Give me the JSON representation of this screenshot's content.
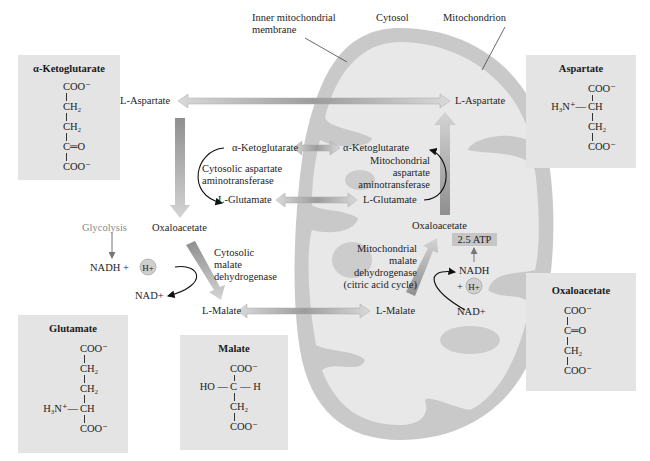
{
  "figure": {
    "top_labels": {
      "inner_membrane_line1": "Inner mitochondrial",
      "inner_membrane_line2": "membrane",
      "cytosol": "Cytosol",
      "mitochondrion": "Mitochondrion"
    },
    "cytosol_side": {
      "l_aspartate": "L-Aspartate",
      "alpha_ketoglutarate": "α-Ketoglutarate",
      "enzyme_aat_line1": "Cytosolic aspartate",
      "enzyme_aat_line2": "aminotransferase",
      "l_glutamate": "L-Glutamate",
      "oxaloacetate": "Oxaloacetate",
      "glycolysis": "Glycolysis",
      "nadh_plus": "NADH +",
      "h_plus": "H+",
      "nad_plus": "NAD+",
      "enzyme_mdh_line1": "Cytosolic",
      "enzyme_mdh_line2": "malate",
      "enzyme_mdh_line3": "dehydrogenase",
      "l_malate": "L-Malate"
    },
    "matrix_side": {
      "l_aspartate": "L-Aspartate",
      "alpha_ketoglutarate": "α-Ketoglutarate",
      "enzyme_aat_line1": "Mitochondrial",
      "enzyme_aat_line2": "aspartate",
      "enzyme_aat_line3": "aminotransferase",
      "l_glutamate": "L-Glutamate",
      "oxaloacetate": "Oxaloacetate",
      "atp": "2.5 ATP",
      "enzyme_mdh_line1": "Mitochondrial",
      "enzyme_mdh_line2": "malate",
      "enzyme_mdh_line3": "dehydrogenase",
      "enzyme_mdh_line4": "(citric acid cycle)",
      "nadh": "NADH",
      "plus": "+",
      "h_plus": "H+",
      "nad_plus": "NAD+",
      "l_malate": "L-Malate"
    },
    "structures": {
      "alpha_ketoglutarate": {
        "title": "α-Ketoglutarate",
        "rows": [
          "COO⁻",
          "CH₂",
          "CH₂",
          "C═O",
          "COO⁻"
        ]
      },
      "aspartate": {
        "title": "Aspartate",
        "rows": [
          "COO⁻",
          "CH",
          "CH₂",
          "COO⁻"
        ],
        "substituent": "H₃N⁺—"
      },
      "glutamate": {
        "title": "Glutamate",
        "rows": [
          "COO⁻",
          "CH₂",
          "CH₂",
          "CH",
          "COO⁻"
        ],
        "substituent": "H₃N⁺—"
      },
      "malate": {
        "title": "Malate",
        "rows": [
          "COO⁻",
          "C",
          "CH₂",
          "COO⁻"
        ],
        "left": "HO —",
        "right": "— H"
      },
      "oxaloacetate": {
        "title": "Oxaloacetate",
        "rows": [
          "COO⁻",
          "C═O",
          "CH₂",
          "COO⁻"
        ]
      }
    },
    "colors": {
      "box_bg": "#e4e4e4",
      "membrane_outer": "#c8c8c8",
      "matrix": "#e6e6e6",
      "arrow_mid": "#9a9a9a",
      "arrow_light": "#d8d8d8"
    }
  }
}
